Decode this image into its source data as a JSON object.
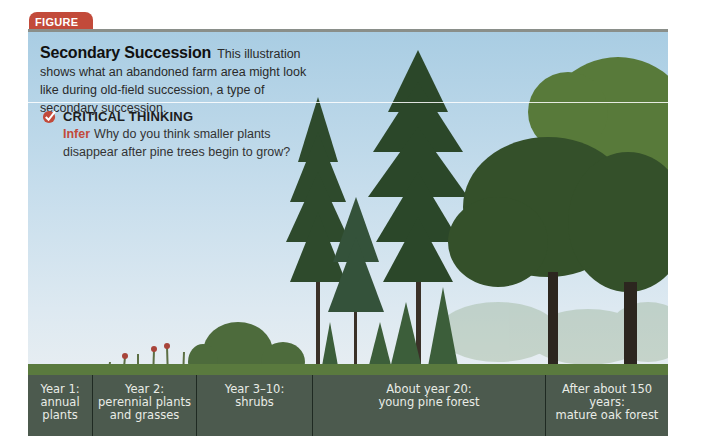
{
  "figure": {
    "tab_label": "FIGURE 3.4",
    "title": "Secondary Succession",
    "caption": "This illustration shows what an abandoned farm area might look like during old-field succession, a type of secondary succession.",
    "critical_thinking": {
      "heading": "CRITICAL THINKING",
      "icon": "checkmark-icon",
      "prompt_label": "Infer",
      "prompt_text": "Why do you think smaller plants disappear after pine trees begin to grow?"
    },
    "stages": [
      {
        "line1": "Year 1:",
        "line2": "annual",
        "line3": "plants"
      },
      {
        "line1": "Year 2:",
        "line2": "perennial plants",
        "line3": "and grasses"
      },
      {
        "line1": "Year 3–10:",
        "line2": "shrubs",
        "line3": ""
      },
      {
        "line1": "About year 20:",
        "line2": "young pine forest",
        "line3": ""
      },
      {
        "line1": "After about 150 years:",
        "line2": "mature oak forest",
        "line3": ""
      }
    ],
    "colors": {
      "accent": "#c24a3a",
      "sky": "#b7d5e8",
      "label_bar": "#4c5a4e",
      "pine": "#2e4a2c",
      "oak": "#3f5a2c"
    }
  }
}
